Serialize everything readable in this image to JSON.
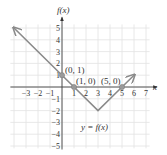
{
  "chart_data": {
    "type": "line",
    "title": "",
    "xlabel": "x",
    "ylabel": "f(x)",
    "xlim": [
      -4,
      7
    ],
    "ylim": [
      -5,
      5
    ],
    "grid": true,
    "x_ticks": [
      -3,
      -2,
      -1,
      1,
      2,
      3,
      4,
      5,
      6,
      7
    ],
    "y_ticks": [
      -5,
      -4,
      -3,
      -2,
      -1,
      1,
      2,
      3,
      4,
      5
    ],
    "series": [
      {
        "name": "y = f(x)",
        "x": [
          -4,
          0,
          1,
          3,
          5,
          6
        ],
        "y": [
          5,
          1,
          0,
          -2,
          0,
          1
        ],
        "arrows": [
          "start",
          "end"
        ],
        "color": "#8a8a8a"
      }
    ],
    "points": [
      {
        "label": "(0, 1)",
        "x": 0,
        "y": 1
      },
      {
        "label": "(1, 0)",
        "x": 1,
        "y": 0
      },
      {
        "label": "(5, 0)",
        "x": 5,
        "y": 0
      }
    ],
    "annotations": [
      {
        "text": "y = f(x)",
        "x": 3,
        "y": -3.5
      }
    ]
  },
  "labels": {
    "y_axis": "f(x)",
    "x_axis": "x",
    "function": "y = f(x)",
    "p1": "(0, 1)",
    "p2": "(1, 0)",
    "p3": "(5, 0)"
  },
  "colors": {
    "grid": "#e2e2e2",
    "axis": "#444444",
    "curve": "#8a8a8a",
    "point": "#9a9a9a"
  }
}
